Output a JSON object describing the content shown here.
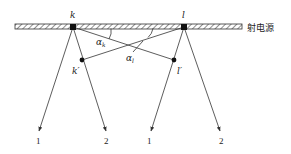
{
  "diagram": {
    "title": "",
    "source_label": "射电源",
    "points": {
      "k": {
        "label": "k",
        "x": 73,
        "y": 27
      },
      "l": {
        "label": "l",
        "x": 184,
        "y": 27
      },
      "k_prime": {
        "label": "k′",
        "x": 82,
        "y": 60
      },
      "l_prime": {
        "label": "l′",
        "x": 174,
        "y": 60
      }
    },
    "angles": {
      "alpha_k": {
        "label": "α",
        "sub": "k"
      },
      "alpha_l": {
        "label": "α",
        "sub": "l"
      }
    },
    "rays": [
      {
        "from": "k",
        "label": "1"
      },
      {
        "from": "k",
        "label": "2"
      },
      {
        "from": "l",
        "label": "1"
      },
      {
        "from": "l",
        "label": "2"
      }
    ],
    "colors": {
      "line": "#333333",
      "hatch": "#444444",
      "point": "#111111"
    }
  }
}
